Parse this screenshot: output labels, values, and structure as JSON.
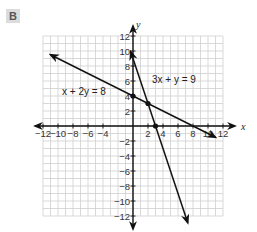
{
  "label": "B",
  "chart_data": {
    "type": "line",
    "title": "",
    "xlabel": "x",
    "ylabel": "y",
    "xlim": [
      -12,
      12
    ],
    "ylim": [
      -12,
      12
    ],
    "grid": true,
    "grid_step": 1,
    "x_ticks": [
      -12,
      -10,
      -8,
      -6,
      -4,
      2,
      4,
      6,
      8,
      10,
      12
    ],
    "y_ticks": [
      12,
      10,
      8,
      6,
      4,
      2,
      -2,
      -4,
      -6,
      -8,
      -10,
      -12
    ],
    "tick_labels": {
      "x": [
        "−12",
        "−10",
        "−8",
        "−6",
        "−4",
        "2",
        "4",
        "6",
        "8",
        "10",
        "12"
      ],
      "y": [
        "12",
        "10",
        "8",
        "6",
        "4",
        "2",
        "−2",
        "−4",
        "−6",
        "−8",
        "−10",
        "−12"
      ]
    },
    "series": [
      {
        "name": "x + 2y = 8",
        "label": "x + 2y = 8",
        "slope": -0.5,
        "intercept": 4,
        "x_range": [
          -11,
          11
        ],
        "points": [
          [
            -11,
            9.5
          ],
          [
            0,
            4
          ],
          [
            8,
            0
          ],
          [
            11,
            -1.5
          ]
        ]
      },
      {
        "name": "3x + y = 9",
        "label": "3x + y = 9",
        "slope": -3,
        "intercept": 9,
        "x_range": [
          -0.3,
          7.3
        ],
        "points": [
          [
            -0.3,
            9.9
          ],
          [
            0,
            9
          ],
          [
            3,
            0
          ],
          [
            7.3,
            -12.9
          ]
        ]
      }
    ],
    "marked_points": [
      {
        "x": 0,
        "y": 4
      },
      {
        "x": 2,
        "y": 3
      },
      {
        "x": 3,
        "y": 0
      }
    ],
    "annotations": [
      {
        "text": "x + 2y = 8",
        "near": "left-upper"
      },
      {
        "text": "3x + y = 9",
        "near": "right-upper"
      }
    ]
  }
}
